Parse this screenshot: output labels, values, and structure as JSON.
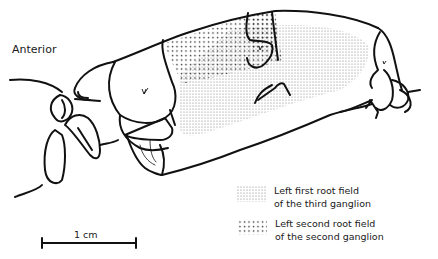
{
  "figure": {
    "orientation_label": "Anterior",
    "scale_bar": {
      "label": "1 cm"
    },
    "legend": [
      {
        "pattern": "fine-stipple",
        "line1": "Left first root field",
        "line2": "of the third ganglion"
      },
      {
        "pattern": "coarse-stipple",
        "line1": "Left second root field",
        "line2": "of the second ganglion"
      }
    ],
    "colors": {
      "ink": "#111111",
      "background": "#ffffff",
      "stipple": "#555555"
    }
  }
}
